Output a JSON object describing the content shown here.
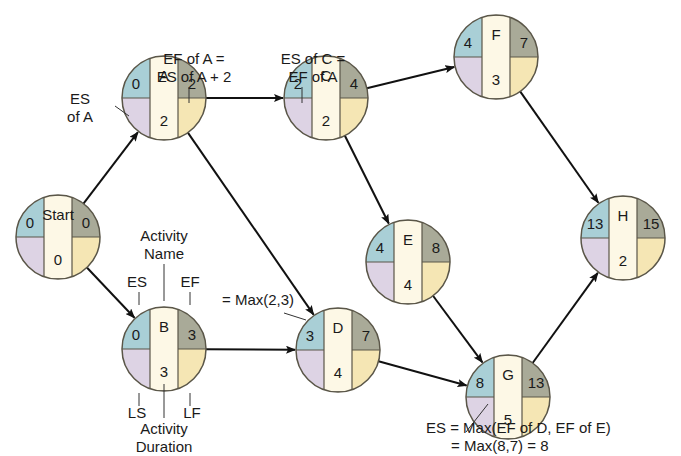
{
  "diagram": {
    "type": "activity-on-node network (forward pass)",
    "colors": {
      "es": "#a9cfd6",
      "ef": "#a9aa98",
      "ls": "#ddd3e4",
      "lf": "#f5e6b4",
      "center": "#fdf8e6",
      "outline": "#5a5648",
      "arrow": "#111111"
    },
    "nodes": [
      {
        "id": "start",
        "name": "Start",
        "es": "0",
        "ef": "0",
        "duration": "0",
        "cx": 58,
        "cy": 237
      },
      {
        "id": "a",
        "name": "A",
        "es": "0",
        "ef": "2",
        "duration": "2",
        "cx": 164,
        "cy": 98
      },
      {
        "id": "b",
        "name": "B",
        "es": "0",
        "ef": "3",
        "duration": "3",
        "cx": 164,
        "cy": 349
      },
      {
        "id": "c",
        "name": "C",
        "es": "2",
        "ef": "4",
        "duration": "2",
        "cx": 326,
        "cy": 98
      },
      {
        "id": "d",
        "name": "D",
        "es": "3",
        "ef": "7",
        "duration": "4",
        "cx": 338,
        "cy": 350
      },
      {
        "id": "e",
        "name": "E",
        "es": "4",
        "ef": "8",
        "duration": "4",
        "cx": 408,
        "cy": 262
      },
      {
        "id": "f",
        "name": "F",
        "es": "4",
        "ef": "7",
        "duration": "3",
        "cx": 496,
        "cy": 57
      },
      {
        "id": "g",
        "name": "G",
        "es": "8",
        "ef": "13",
        "duration": "5",
        "cx": 508,
        "cy": 397
      },
      {
        "id": "h",
        "name": "H",
        "es": "13",
        "ef": "15",
        "duration": "2",
        "cx": 623,
        "cy": 238
      }
    ],
    "edges": [
      [
        "start",
        "a"
      ],
      [
        "start",
        "b"
      ],
      [
        "a",
        "c"
      ],
      [
        "a",
        "d"
      ],
      [
        "b",
        "d"
      ],
      [
        "c",
        "f"
      ],
      [
        "c",
        "e"
      ],
      [
        "e",
        "g"
      ],
      [
        "d",
        "g"
      ],
      [
        "f",
        "h"
      ],
      [
        "g",
        "h"
      ]
    ],
    "annotations": {
      "es_of_a": [
        "ES",
        "of A"
      ],
      "ef_of_a": [
        "EF of A =",
        "ES of A + 2"
      ],
      "es_of_c": [
        "ES of C =",
        "EF of A"
      ],
      "legend_activity_name": [
        "Activity",
        "Name"
      ],
      "legend_es": "ES",
      "legend_ef": "EF",
      "legend_ls": "LS",
      "legend_lf": "LF",
      "legend_duration": [
        "Activity",
        "Duration"
      ],
      "max_d": "= Max(2,3)",
      "es_g": [
        "ES = Max(EF of D, EF of E)",
        "= Max(8,7) = 8"
      ]
    }
  }
}
